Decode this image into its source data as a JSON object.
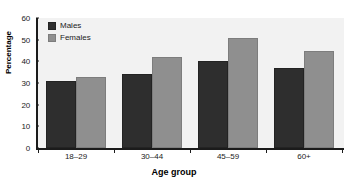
{
  "chart_data": {
    "type": "bar",
    "title": "",
    "xlabel": "Age group",
    "ylabel": "Percentage",
    "categories": [
      "18–29",
      "30–44",
      "45–59",
      "60+"
    ],
    "series": [
      {
        "name": "Males",
        "color": "#2e2e2e",
        "values": [
          31,
          34,
          40,
          37
        ]
      },
      {
        "name": "Females",
        "color": "#8f8f8f",
        "values": [
          33,
          42,
          51,
          45
        ]
      }
    ],
    "ylim": [
      0,
      60
    ],
    "yticks": [
      0,
      10,
      20,
      30,
      40,
      50,
      60
    ],
    "ytick_labels": [
      "0",
      "10",
      "20",
      "30",
      "40",
      "50",
      "60"
    ],
    "grid": false,
    "legend_position": "top-left",
    "plot_background": "#f2f2f2",
    "axis_color": "#1b1b1b"
  },
  "axes": {
    "y_title": "Percentage",
    "x_title": "Age group"
  },
  "legend": {
    "entries": [
      {
        "label": "Males",
        "swatch": "male"
      },
      {
        "label": "Females",
        "swatch": "female"
      }
    ]
  }
}
